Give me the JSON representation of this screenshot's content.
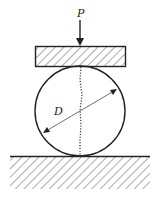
{
  "diagram": {
    "type": "mechanics-compression-test",
    "labels": {
      "load": "P",
      "diameter": "D"
    },
    "elements": [
      {
        "name": "load-arrow",
        "label": "P",
        "direction": "down"
      },
      {
        "name": "top-plate",
        "hatched": true
      },
      {
        "name": "cylinder-disk",
        "shape": "circle"
      },
      {
        "name": "diameter-dimension",
        "label": "D"
      },
      {
        "name": "vertical-dotted-line",
        "style": "dotted"
      },
      {
        "name": "ground-support",
        "hatched": true
      }
    ],
    "colors": {
      "stroke": "#222222",
      "background": "#ffffff"
    }
  }
}
